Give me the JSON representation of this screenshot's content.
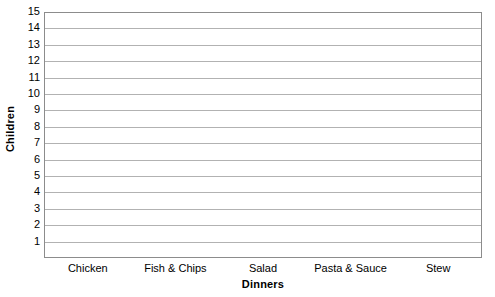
{
  "chart_data": {
    "type": "bar",
    "title": "",
    "xlabel": "Dinners",
    "ylabel": "Children",
    "categories": [
      "Chicken",
      "Fish & Chips",
      "Salad",
      "Pasta & Sauce",
      "Stew"
    ],
    "values": [
      null,
      null,
      null,
      null,
      null
    ],
    "ytick_labels": [
      "15",
      "14",
      "13",
      "12",
      "11",
      "10",
      "9",
      "8",
      "7",
      "6",
      "5",
      "4",
      "3",
      "2",
      "1"
    ],
    "ytick_values": [
      15,
      14,
      13,
      12,
      11,
      10,
      9,
      8,
      7,
      6,
      5,
      4,
      3,
      2,
      1
    ],
    "ylim": [
      0,
      15
    ],
    "ystep": 1,
    "grid": true,
    "legend": false,
    "legend_position": "none",
    "note": "Empty blank bar-chart grid template — no bars are drawn",
    "colors": {
      "background": "#ffffff",
      "gridline": "#b2b2b2",
      "axis_border": "#8c8c8c",
      "text": "#000000"
    }
  }
}
